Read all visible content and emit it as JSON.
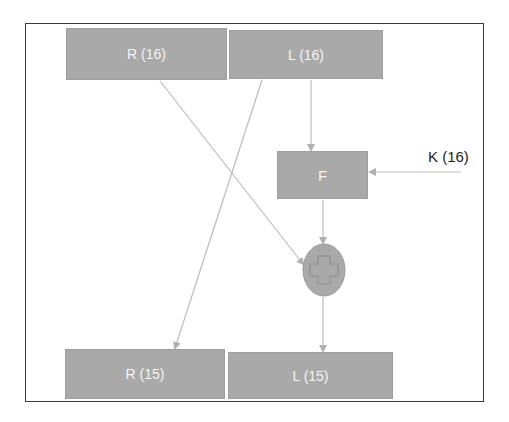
{
  "diagram": {
    "type": "feistel-round",
    "nodes": {
      "r_in": {
        "label": "R (16)"
      },
      "l_in": {
        "label": "L (16)"
      },
      "f": {
        "label": "F"
      },
      "key": {
        "label": "K (16)"
      },
      "xor": {
        "label": "+",
        "shape": "ellipse-with-plus"
      },
      "r_out": {
        "label": "R (15)"
      },
      "l_out": {
        "label": "L (15)"
      }
    },
    "edges": [
      {
        "from": "l_in",
        "to": "f"
      },
      {
        "from": "key",
        "to": "f"
      },
      {
        "from": "f",
        "to": "xor"
      },
      {
        "from": "r_in",
        "to": "xor"
      },
      {
        "from": "l_in",
        "to": "r_out"
      },
      {
        "from": "xor",
        "to": "l_out"
      }
    ],
    "colors": {
      "box_fill": "#a9a9a9",
      "box_text": "#f4f4f4",
      "wire": "#b8b8b8",
      "frame": "#3a3a3a"
    }
  }
}
